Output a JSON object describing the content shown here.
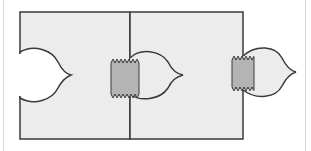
{
  "diagram": {
    "colors": {
      "panel_fill": "#ececec",
      "outline": "#3a3a3a",
      "tape_fill": "#b4b4b4",
      "cutout_fill": "#ffffff",
      "frame_line": "#d8d8d8",
      "background": "#ffffff"
    },
    "panels": [
      {
        "name": "left-panel",
        "x": 20,
        "y": 12,
        "width": 110,
        "height": 127
      },
      {
        "name": "right-panel",
        "x": 130,
        "y": 12,
        "width": 113,
        "height": 127
      }
    ],
    "tabs": [
      {
        "name": "left-cutout",
        "type": "cutout"
      },
      {
        "name": "middle-tab",
        "type": "tab"
      },
      {
        "name": "right-tab",
        "type": "tab"
      }
    ],
    "tapes": [
      {
        "name": "middle-tape",
        "x": 111,
        "y": 61,
        "width": 28,
        "height": 35
      },
      {
        "name": "right-tape",
        "x": 232,
        "y": 58,
        "width": 22,
        "height": 31
      }
    ]
  }
}
